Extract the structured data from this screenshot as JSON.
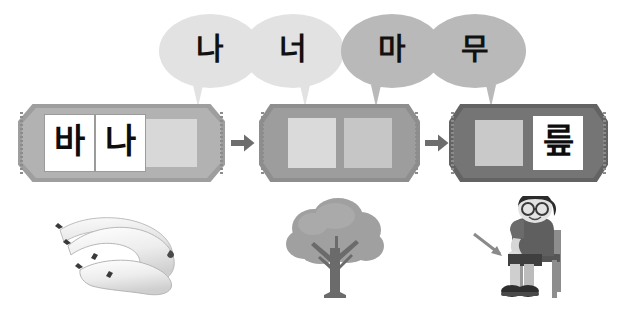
{
  "page": {
    "background_color": "#ffffff"
  },
  "colors": {
    "bubble_light": "#e2e2e2",
    "bubble_dark": "#b9b9b9",
    "ticket_light_frame": "#a8a8a8",
    "ticket_light_face": "#b5b5b5",
    "ticket_mid_face": "#9a9a9a",
    "ticket_dark_face": "#6f6f6f",
    "slot_empty": "#d6d6d6",
    "slot_filled": "#ffffff",
    "arrow": "#6d6d6d",
    "text": "#111111"
  },
  "bubbles": [
    {
      "id": "bubble-1",
      "syllable": "나",
      "tone": "light"
    },
    {
      "id": "bubble-2",
      "syllable": "너",
      "tone": "light"
    },
    {
      "id": "bubble-3",
      "syllable": "마",
      "tone": "dark"
    },
    {
      "id": "bubble-4",
      "syllable": "무",
      "tone": "dark"
    }
  ],
  "tickets": [
    {
      "id": "ticket-1",
      "tone": "light",
      "word": "바나나",
      "slots": [
        {
          "syllable": "바",
          "state": "filled"
        },
        {
          "syllable": "나",
          "state": "filled"
        },
        {
          "syllable": "",
          "state": "empty"
        }
      ]
    },
    {
      "id": "ticket-2",
      "tone": "mid",
      "word": "나무",
      "slots": [
        {
          "syllable": "",
          "state": "empty"
        },
        {
          "syllable": "",
          "state": "empty"
        }
      ]
    },
    {
      "id": "ticket-3",
      "tone": "dark",
      "word": "무릎",
      "slots": [
        {
          "syllable": "",
          "state": "empty"
        },
        {
          "syllable": "릎",
          "state": "filled"
        }
      ]
    }
  ],
  "arrows": [
    {
      "id": "arrow-1",
      "glyph": "→"
    },
    {
      "id": "arrow-2",
      "glyph": "→"
    }
  ],
  "illustrations": [
    {
      "id": "banana-illustration",
      "name": "bananas",
      "alt": "바나나"
    },
    {
      "id": "tree-illustration",
      "name": "tree",
      "alt": "나무"
    },
    {
      "id": "boy-illustration",
      "name": "boy-sitting-on-chair-knee-arrow",
      "alt": "무릎"
    }
  ]
}
